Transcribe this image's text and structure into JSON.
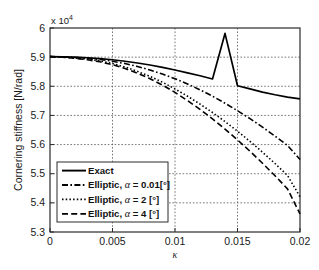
{
  "chart_data": {
    "type": "line",
    "title": "",
    "xlabel": "κ",
    "ylabel": "Cornering stiffness [N/rad]",
    "y_multiplier": "x 10",
    "y_multiplier_exponent": "4",
    "xlim": [
      0,
      0.02
    ],
    "ylim": [
      5.3,
      6.0
    ],
    "x_ticks": [
      "0",
      "0.005",
      "0.01",
      "0.015",
      "0.02"
    ],
    "x_tick_values": [
      0,
      0.005,
      0.01,
      0.015,
      0.02
    ],
    "y_ticks": [
      "5.3",
      "5.4",
      "5.5",
      "5.6",
      "5.7",
      "5.8",
      "5.9",
      "6"
    ],
    "y_tick_values": [
      5.3,
      5.4,
      5.5,
      5.6,
      5.7,
      5.8,
      5.9,
      6.0
    ],
    "grid": true,
    "grid_style": "dotted",
    "legend_position": "lower left",
    "x": [
      0,
      0.001,
      0.002,
      0.003,
      0.004,
      0.005,
      0.006,
      0.007,
      0.008,
      0.009,
      0.01,
      0.011,
      0.012,
      0.013,
      0.014,
      0.015,
      0.016,
      0.017,
      0.018,
      0.019,
      0.02
    ],
    "series": [
      {
        "name": "Exact",
        "label": "Exact",
        "style": "solid",
        "color": "#000000",
        "values": [
          5.902,
          5.901,
          5.9,
          5.898,
          5.895,
          5.891,
          5.886,
          5.88,
          5.873,
          5.865,
          5.856,
          5.846,
          5.836,
          5.825,
          5.9814,
          5.802,
          5.791,
          5.78,
          5.771,
          5.763,
          5.757
        ]
      },
      {
        "name": "Elliptic, alpha = 0.01 deg",
        "label_prefix": "Elliptic, ",
        "label_alpha": "α",
        "label_suffix": " = 0.01[°]",
        "style": "dash-dot",
        "color": "#000000",
        "values": [
          5.902,
          5.901,
          5.899,
          5.896,
          5.892,
          5.886,
          5.878,
          5.868,
          5.856,
          5.842,
          5.826,
          5.808,
          5.788,
          5.766,
          5.742,
          5.716,
          5.689,
          5.66,
          5.629,
          5.597,
          5.549
        ]
      },
      {
        "name": "Elliptic, alpha = 2 deg",
        "label_prefix": "Elliptic, ",
        "label_alpha": "α",
        "label_suffix": " = 2 [°]",
        "style": "dotted",
        "color": "#000000",
        "values": [
          5.902,
          5.9,
          5.897,
          5.893,
          5.887,
          5.878,
          5.866,
          5.851,
          5.834,
          5.814,
          5.791,
          5.766,
          5.739,
          5.71,
          5.679,
          5.646,
          5.611,
          5.574,
          5.535,
          5.494,
          5.421
        ]
      },
      {
        "name": "Elliptic, alpha = 4 deg",
        "label_prefix": "Elliptic, ",
        "label_alpha": "α",
        "label_suffix": " = 4 [°]",
        "style": "dashed",
        "color": "#000000",
        "values": [
          5.902,
          5.9,
          5.896,
          5.891,
          5.884,
          5.874,
          5.861,
          5.845,
          5.826,
          5.804,
          5.779,
          5.751,
          5.721,
          5.688,
          5.653,
          5.616,
          5.577,
          5.536,
          5.493,
          5.448,
          5.362
        ]
      }
    ],
    "legend": [
      {
        "label": "Exact",
        "style": "solid"
      },
      {
        "label": "Elliptic, α = 0.01[°]",
        "style": "dash-dot"
      },
      {
        "label": "Elliptic, α = 2 [°]",
        "style": "dotted"
      },
      {
        "label": "Elliptic, α = 4 [°]",
        "style": "dashed"
      }
    ]
  }
}
